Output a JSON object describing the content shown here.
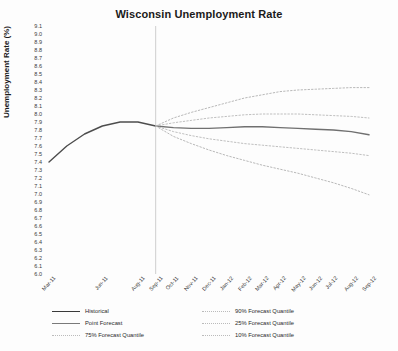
{
  "chart_data": {
    "type": "line",
    "title": "Wisconsin Unemployment Rate",
    "xlabel": "",
    "ylabel": "Unemployment Rate (%)",
    "ylim": [
      6.0,
      9.1
    ],
    "grid": false,
    "legend_position": "bottom",
    "x": [
      "Mar-11",
      "Apr-11",
      "May-11",
      "Jun-11",
      "Jul-11",
      "Aug-11",
      "Sep-11",
      "Oct-11",
      "Nov-11",
      "Dec-11",
      "Jan-12",
      "Feb-12",
      "Mar-12",
      "Apr-12",
      "May-12",
      "Jun-12",
      "Jul-12",
      "Aug-12",
      "Sep-12"
    ],
    "xtick_labels": [
      "Mar-11",
      "Jun-11",
      "Aug-11",
      "Sep-11",
      "Oct-11",
      "Nov-11",
      "Dec-11",
      "Jan-12",
      "Feb-12",
      "Mar-12",
      "Apr-12",
      "May-12",
      "Jun-12",
      "Jul-12",
      "Aug-12",
      "Sep-12"
    ],
    "ytick_labels": [
      "9.1",
      "9.0",
      "8.9",
      "8.8",
      "8.7",
      "8.6",
      "8.5",
      "8.4",
      "8.3",
      "8.2",
      "8.1",
      "8.0",
      "7.9",
      "7.8",
      "7.7",
      "7.6",
      "7.5",
      "7.4",
      "7.3",
      "7.2",
      "7.1",
      "7.0",
      "6.9",
      "6.8",
      "6.7",
      "6.6",
      "6.5",
      "6.4",
      "6.3",
      "6.2",
      "6.1",
      "6.0"
    ],
    "forecast_start_label": "Sep-11",
    "series": [
      {
        "name": "Historical",
        "style": "solid",
        "color": "#4d4d4d",
        "values": [
          7.4,
          7.6,
          7.75,
          7.85,
          7.9,
          7.9,
          7.85,
          null,
          null,
          null,
          null,
          null,
          null,
          null,
          null,
          null,
          null,
          null,
          null
        ]
      },
      {
        "name": "Point Forecast",
        "style": "solid",
        "color": "#707070",
        "values": [
          null,
          null,
          null,
          null,
          null,
          null,
          7.85,
          7.83,
          7.82,
          7.82,
          7.83,
          7.84,
          7.84,
          7.83,
          7.82,
          7.81,
          7.8,
          7.78,
          7.74
        ]
      },
      {
        "name": "90% Forecast Quantile",
        "style": "dotted",
        "color": "#b0b0b0",
        "values": [
          null,
          null,
          null,
          null,
          null,
          null,
          7.85,
          7.95,
          8.02,
          8.08,
          8.14,
          8.2,
          8.24,
          8.28,
          8.3,
          8.31,
          8.32,
          8.33,
          8.33
        ]
      },
      {
        "name": "75% Forecast Quantile",
        "style": "dotted",
        "color": "#b8b8b8",
        "values": [
          null,
          null,
          null,
          null,
          null,
          null,
          7.85,
          7.89,
          7.92,
          7.95,
          7.97,
          7.99,
          8.0,
          8.0,
          8.0,
          7.99,
          7.98,
          7.97,
          7.95
        ]
      },
      {
        "name": "25% Forecast Quantile",
        "style": "dotted",
        "color": "#b8b8b8",
        "values": [
          null,
          null,
          null,
          null,
          null,
          null,
          7.85,
          7.78,
          7.73,
          7.69,
          7.66,
          7.63,
          7.61,
          7.59,
          7.57,
          7.55,
          7.53,
          7.51,
          7.48
        ]
      },
      {
        "name": "10% Forecast Quantile",
        "style": "dotted",
        "color": "#b0b0b0",
        "values": [
          null,
          null,
          null,
          null,
          null,
          null,
          7.85,
          7.72,
          7.63,
          7.55,
          7.48,
          7.42,
          7.36,
          7.31,
          7.26,
          7.2,
          7.14,
          7.07,
          6.99
        ]
      }
    ],
    "legend_entries": [
      {
        "label": "Historical",
        "style": "solid",
        "color": "#3a3a3a"
      },
      {
        "label": "90% Forecast Quantile",
        "style": "dotted",
        "color": "#bbbbbb"
      },
      {
        "label": "Point Forecast",
        "style": "solid",
        "color": "#7a7a7a"
      },
      {
        "label": "25% Forecast Quantile",
        "style": "dotted",
        "color": "#bbbbbb"
      },
      {
        "label": "75% Forecast Quantile",
        "style": "dotted",
        "color": "#bbbbbb"
      },
      {
        "label": "10% Forecast Quantile",
        "style": "dotted",
        "color": "#bbbbbb"
      }
    ]
  }
}
